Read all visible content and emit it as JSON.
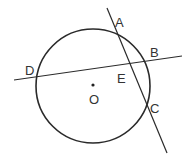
{
  "diagram": {
    "title": "",
    "circle": {
      "center_label": "O"
    },
    "points": [
      {
        "name": "A",
        "label": "A"
      },
      {
        "name": "B",
        "label": "B"
      },
      {
        "name": "C",
        "label": "C"
      },
      {
        "name": "D",
        "label": "D"
      },
      {
        "name": "E",
        "label": "E"
      },
      {
        "name": "O",
        "label": "O"
      }
    ],
    "lines": [
      {
        "name": "line-AC",
        "through": [
          "A",
          "E",
          "C"
        ]
      },
      {
        "name": "line-DB",
        "through": [
          "D",
          "E",
          "B"
        ]
      }
    ],
    "colors": {
      "stroke": "#2a2a2a",
      "text": "#333333",
      "background": "#ffffff"
    }
  }
}
